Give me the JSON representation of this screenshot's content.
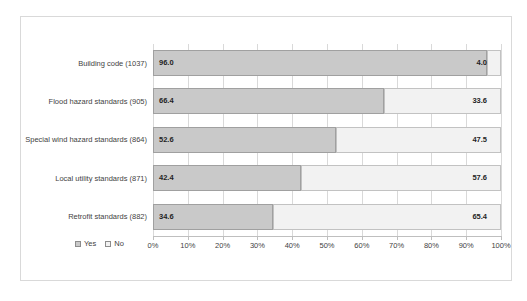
{
  "figure": {
    "background": "#ffffff",
    "frame_border_color": "#d9d9d9"
  },
  "chart_data": {
    "type": "bar",
    "orientation": "horizontal",
    "stacked": true,
    "title": "",
    "xlabel": "",
    "ylabel": "",
    "categories": [
      "Building code (1037)",
      "Flood hazard standards (905)",
      "Special wind hazard standards (864)",
      "Local utility standards (871)",
      "Retrofit standards (882)"
    ],
    "series": [
      {
        "name": "Yes",
        "values": [
          96.0,
          66.4,
          52.6,
          42.4,
          34.6
        ],
        "labels": [
          "96.0",
          "66.4",
          "52.6",
          "42.4",
          "34.6"
        ],
        "fill": "#c9c9c9",
        "border": "#a0a0a0"
      },
      {
        "name": "No",
        "values": [
          4.0,
          33.6,
          47.5,
          57.6,
          65.4
        ],
        "labels": [
          "4.0",
          "33.6",
          "47.5",
          "57.6",
          "65.4"
        ],
        "fill": "#f2f2f2",
        "border": "#c2c2c2"
      }
    ],
    "x_ticks": [
      "0%",
      "10%",
      "20%",
      "30%",
      "40%",
      "50%",
      "60%",
      "70%",
      "80%",
      "90%",
      "100%"
    ],
    "xlim": [
      0,
      100
    ],
    "grid": true,
    "gridline_color": "#d9d9d9",
    "axis_line_color": "#bfbfbf",
    "text_color": "#3f3f3f",
    "value_label_color": "#1f1f1f",
    "legend_position": "bottom-left"
  }
}
